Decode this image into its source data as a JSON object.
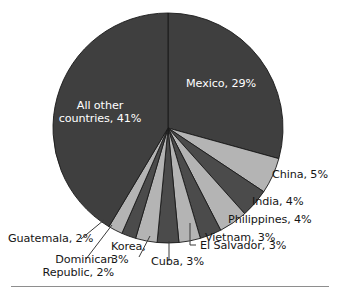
{
  "chart_data": {
    "type": "pie",
    "title": "",
    "subtitle": "",
    "xlabel": "",
    "ylabel": "",
    "legend_position": "none",
    "grid": false,
    "start_angle_deg": 0,
    "direction": "clockwise",
    "units": "percent",
    "categories": [
      "Mexico",
      "China",
      "India",
      "Philippines",
      "Vietnam",
      "El Salvador",
      "Cuba",
      "Korea",
      "Dominican Republic",
      "Guatemala",
      "All other countries"
    ],
    "values": [
      29,
      5,
      4,
      4,
      3,
      3,
      3,
      3,
      2,
      2,
      41
    ],
    "slices": [
      {
        "name": "Mexico",
        "value": 29,
        "label": "Mexico, 29%",
        "color": "#3f3f3f",
        "label_placement": "inside",
        "label_color": "#ffffff",
        "label_x": 186,
        "label_y": 77,
        "leader": null
      },
      {
        "name": "China",
        "value": 5,
        "label": "China, 5%",
        "color": "#b4b4b4",
        "label_placement": "outside",
        "label_color": "#161616",
        "label_x": 272,
        "label_y": 168,
        "leader": null
      },
      {
        "name": "India",
        "value": 4,
        "label": "India, 4%",
        "color": "#4b4b4b",
        "label_placement": "outside",
        "label_color": "#161616",
        "label_x": 252,
        "label_y": 195,
        "leader": null
      },
      {
        "name": "Philippines",
        "value": 4,
        "label": "Philippines, 4%",
        "color": "#b4b4b4",
        "label_placement": "outside",
        "label_color": "#161616",
        "label_x": 228,
        "label_y": 213,
        "leader": null
      },
      {
        "name": "Vietnam",
        "value": 3,
        "label": "Vietnam, 3%",
        "color": "#4b4b4b",
        "label_placement": "outside",
        "label_color": "#161616",
        "label_x": 205,
        "label_y": 231,
        "leader": null
      },
      {
        "name": "El Salvador",
        "value": 3,
        "label": "El Salvador, 3%",
        "color": "#b4b4b4",
        "label_placement": "outside",
        "label_color": "#161616",
        "label_x": 197,
        "label_y": 248,
        "leader": "elbow"
      },
      {
        "name": "Cuba",
        "value": 3,
        "label": "Cuba, 3%",
        "color": "#4b4b4b",
        "label_placement": "outside",
        "label_color": "#161616",
        "label_x": 151,
        "label_y": 262,
        "leader": "vertical"
      },
      {
        "name": "Korea",
        "value": 3,
        "label": "Korea, 3%",
        "color": "#b4b4b4",
        "label_placement": "outside",
        "label_color": "#161616",
        "label_x": 117,
        "label_y": 242,
        "leader": "vertical"
      },
      {
        "name": "Dominican Republic",
        "value": 2,
        "label": "Dominican Republic, 2%",
        "color": "#4b4b4b",
        "label_placement": "outside",
        "label_color": "#161616",
        "label_x": 32,
        "label_y": 255,
        "leader": "diagonal"
      },
      {
        "name": "Guatemala",
        "value": 2,
        "label": "Guatemala, 2%",
        "color": "#b4b4b4",
        "label_placement": "outside",
        "label_color": "#161616",
        "label_x": 8,
        "label_y": 232,
        "leader": "diagonal"
      },
      {
        "name": "All other countries",
        "value": 41,
        "label": "All other countries, 41%",
        "color": "#3f3f3f",
        "label_placement": "inside",
        "label_color": "#ffffff",
        "label_x": 66,
        "label_y": 99,
        "leader": null
      }
    ]
  },
  "labels": {
    "mexico": "Mexico, 29%",
    "all_other_line1": "All other",
    "all_other_line2": "countries, 41%",
    "china": "China, 5%",
    "india": "India, 4%",
    "philippines": "Philippines, 4%",
    "vietnam": "Vietnam, 3%",
    "el_salvador": "El Salvador, 3%",
    "cuba": "Cuba, 3%",
    "korea_line1": "Korea,",
    "korea_line2": "3%",
    "dominican_line1": "Dominican",
    "dominican_line2": "Republic, 2%",
    "guatemala": "Guatemala, 2%"
  },
  "geometry": {
    "center_x": 168,
    "center_y": 128,
    "radius": 115
  },
  "colors": {
    "dark_slice": "#3f3f3f",
    "mid_dark_slice": "#4b4b4b",
    "light_slice": "#b4b4b4",
    "slice_border": "#1a1a1a",
    "label_text": "#161616",
    "inside_label_text": "#ffffff",
    "rule": "#8e8e8e",
    "background": "#ffffff"
  }
}
